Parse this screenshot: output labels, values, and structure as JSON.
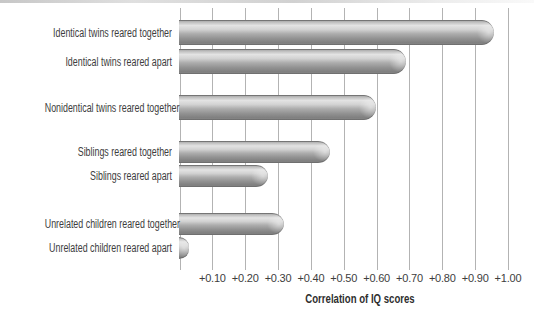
{
  "chart_data": {
    "type": "bar",
    "orientation": "horizontal",
    "title": "",
    "xlabel": "Correlation of IQ scores",
    "categories": [
      "Identical twins reared together",
      "Identical twins reared apart",
      "Nonidentical twins reared together",
      "Siblings reared together",
      "Siblings reared apart",
      "Unrelated children reared together",
      "Unrelated children reared apart"
    ],
    "values": [
      0.96,
      0.69,
      0.6,
      0.46,
      0.27,
      0.32,
      0.03
    ],
    "groups": [
      [
        0,
        1
      ],
      [
        2
      ],
      [
        3,
        4
      ],
      [
        5,
        6
      ]
    ],
    "x_ticks": [
      {
        "label": "+0.10",
        "value": 0.1
      },
      {
        "label": "+0.20",
        "value": 0.2
      },
      {
        "label": "+0.30",
        "value": 0.3
      },
      {
        "label": "+0.40",
        "value": 0.4
      },
      {
        "label": "+0.50",
        "value": 0.5
      },
      {
        "label": "+0.60",
        "value": 0.6
      },
      {
        "label": "+0.70",
        "value": 0.7
      },
      {
        "label": "+0.80",
        "value": 0.8
      },
      {
        "label": "+0.90",
        "value": 0.9
      },
      {
        "label": "+1.00",
        "value": 1.0
      }
    ],
    "xlim": [
      0,
      1.0
    ],
    "grid": "vertical",
    "legend_position": "none",
    "colors": {
      "bar_highlight": "#e3e3e3",
      "bar_mid": "#adadad",
      "bar_dark": "#7e7e7e",
      "gridline": "#b3b3b3",
      "text": "#3d3d3d",
      "axis_title_text": "#2e2e2e",
      "background": "#ffffff"
    }
  }
}
